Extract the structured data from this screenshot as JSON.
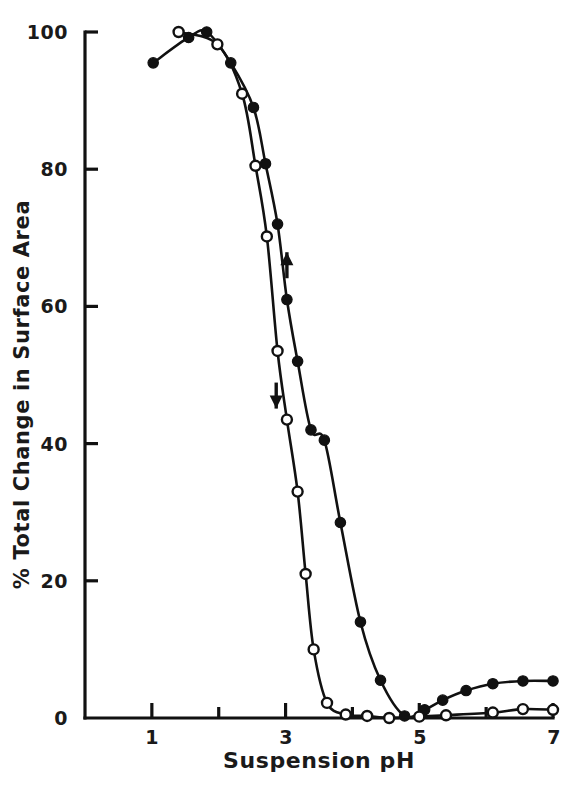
{
  "chart_data": {
    "type": "line",
    "title": "",
    "xlabel": "Suspension pH",
    "ylabel": "% Total Change in Surface Area",
    "xlim": [
      0,
      7
    ],
    "ylim": [
      0,
      100
    ],
    "xticks": [
      1,
      2,
      3,
      4,
      5,
      6,
      7
    ],
    "xtick_labels": [
      "1",
      "",
      "3",
      "",
      "5",
      "",
      "7"
    ],
    "yticks": [
      0,
      20,
      40,
      60,
      80,
      100
    ],
    "ytick_labels": [
      "0",
      "20",
      "40",
      "60",
      "80",
      "100"
    ],
    "grid": false,
    "legend": "none",
    "axis_spines": [
      "left",
      "bottom"
    ],
    "tick_direction": "in",
    "series": [
      {
        "name": "filled-circle-titration",
        "marker": "filled-circle",
        "marker_color": "#111111",
        "line_color": "#111111",
        "direction_arrow": "up",
        "arrow_x": 3.02,
        "arrow_y": 66.0,
        "x": [
          1.02,
          1.55,
          1.82,
          2.18,
          2.52,
          2.7,
          2.88,
          3.02,
          3.18,
          3.38,
          3.58,
          3.82,
          4.12,
          4.42,
          4.78,
          5.08,
          5.35,
          5.7,
          6.1,
          6.55,
          7.0
        ],
        "y": [
          95.5,
          99.2,
          100.0,
          95.5,
          89.0,
          80.8,
          72.0,
          61.0,
          52.0,
          42.0,
          40.5,
          28.5,
          14.0,
          5.5,
          0.3,
          1.2,
          2.6,
          4.0,
          5.0,
          5.4,
          5.4
        ]
      },
      {
        "name": "open-circle-titration",
        "marker": "open-circle",
        "marker_color": "#ffffff",
        "line_color": "#111111",
        "direction_arrow": "down",
        "arrow_x": 2.86,
        "arrow_y": 47.0,
        "x": [
          1.4,
          1.98,
          2.35,
          2.55,
          2.72,
          2.88,
          3.02,
          3.18,
          3.3,
          3.42,
          3.62,
          3.9,
          4.22,
          4.55,
          5.0,
          5.4,
          6.1,
          6.55,
          7.0
        ],
        "y": [
          100.0,
          98.2,
          91.0,
          80.5,
          70.2,
          53.5,
          43.5,
          33.0,
          21.0,
          10.0,
          2.2,
          0.5,
          0.3,
          0.0,
          0.2,
          0.4,
          0.8,
          1.3,
          1.2
        ]
      }
    ]
  },
  "axes": {
    "x_title": "Suspension pH",
    "y_title": "% Total Change in Surface Area",
    "y_labels": [
      "100",
      "80",
      "60",
      "40",
      "20",
      "0"
    ],
    "x_labels": [
      "1",
      "3",
      "5",
      "7"
    ]
  },
  "colors": {
    "ink": "#111111",
    "background": "#ffffff",
    "marker_fill": "#111111",
    "marker_open": "#ffffff"
  }
}
